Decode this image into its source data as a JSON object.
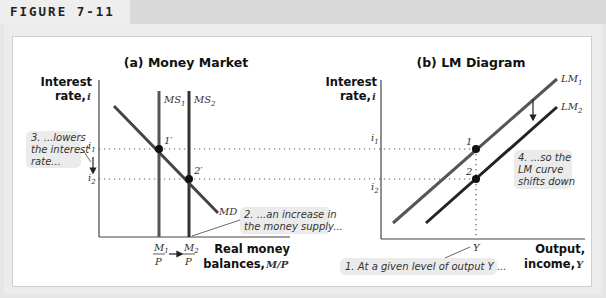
{
  "figure": {
    "label": "FIGURE 7-11"
  },
  "panel_a": {
    "title": "(a) Money Market",
    "y_axis_label": [
      "Interest",
      "rate, "
    ],
    "y_axis_symbol": "i",
    "x_axis_label": [
      "Real money",
      "balances, "
    ],
    "x_axis_symbol": "M/P",
    "ticks_y": [
      {
        "base": "i",
        "sub": "1"
      },
      {
        "base": "i",
        "sub": "2"
      }
    ],
    "ticks_x": [
      {
        "num": "M",
        "sub": "1",
        "den": "P"
      },
      {
        "num": "M",
        "sub": "2",
        "den": "P"
      }
    ],
    "curves": {
      "ms1": {
        "base": "MS",
        "sub": "1"
      },
      "ms2": {
        "base": "MS",
        "sub": "2"
      },
      "md": "MD"
    },
    "points": [
      {
        "label": "1′"
      },
      {
        "label": "2′"
      }
    ],
    "callouts": {
      "step3": [
        "3. ...lowers",
        "the interest",
        "rate..."
      ],
      "step2": [
        "2. ...an increase in",
        "the money supply..."
      ]
    }
  },
  "panel_b": {
    "title": "(b) LM Diagram",
    "y_axis_label": [
      "Interest",
      "rate, "
    ],
    "y_axis_symbol": "i",
    "x_axis_label": [
      "Output,",
      "income, "
    ],
    "x_axis_symbol": "Y",
    "ticks_y": [
      {
        "base": "i",
        "sub": "1"
      },
      {
        "base": "i",
        "sub": "2"
      }
    ],
    "tick_x": "Y",
    "curves": {
      "lm1": {
        "base": "LM",
        "sub": "1"
      },
      "lm2": {
        "base": "LM",
        "sub": "2"
      }
    },
    "points": [
      {
        "label": "1"
      },
      {
        "label": "2"
      }
    ],
    "callouts": {
      "step4": [
        "4. ...so the",
        "LM curve",
        "shifts down"
      ],
      "step1": [
        "1. At a given level of output Y ..."
      ]
    }
  },
  "colors": {
    "curve_light": "#555555",
    "curve_dark": "#222222",
    "callout_bg": "#ebebeb",
    "frame_bg": "#ececec",
    "header_bg": "#d9d9d9"
  }
}
